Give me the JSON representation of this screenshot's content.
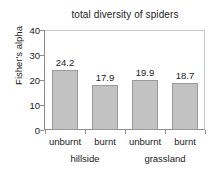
{
  "chart_data": {
    "type": "bar",
    "title": "total diversity of spiders",
    "xlabel": "",
    "ylabel": "Fisher's alpha",
    "categories": [
      "unburnt",
      "burnt",
      "unburnt",
      "burnt"
    ],
    "values": [
      24.2,
      17.9,
      19.9,
      18.7
    ],
    "value_labels": [
      "24.2",
      "17.9",
      "19.9",
      "18.7"
    ],
    "groups": [
      {
        "label": "hillside",
        "categories": [
          "unburnt",
          "burnt"
        ]
      },
      {
        "label": "grassland",
        "categories": [
          "unburnt",
          "burnt"
        ]
      }
    ],
    "group_labels": [
      "hillside",
      "grassland"
    ],
    "ylim": [
      0,
      40
    ],
    "yticks": [
      0,
      10,
      20,
      30,
      40
    ],
    "ytick_labels": [
      "0",
      "10",
      "20",
      "30",
      "40"
    ],
    "grid": false,
    "legend": false,
    "bar_fill_color": "#c2c2c2",
    "bar_border_color": "#9a9a9a",
    "axis_color": "#8c8c8c",
    "text_color": "#1a1a1a",
    "background_color": "#ffffff"
  }
}
